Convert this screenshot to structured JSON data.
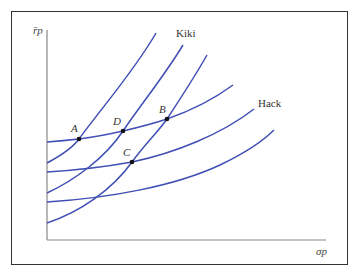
{
  "figure": {
    "y_axis_label": "r̄p",
    "x_axis_label": "σp",
    "curve_color": "#3f4fb5",
    "axis_color": "#888888",
    "frame_color": "#333333"
  },
  "labels": {
    "kiki": "Kiki",
    "hack": "Hack"
  },
  "points": [
    {
      "name": "A",
      "x": 79,
      "y": 139
    },
    {
      "name": "D",
      "x": 123,
      "y": 131
    },
    {
      "name": "B",
      "x": 167,
      "y": 119
    },
    {
      "name": "C",
      "x": 132,
      "y": 162
    }
  ],
  "curves": {
    "kiki": [
      {
        "id": "kiki-1",
        "path": "M47,163 C62,155 74,146 79,139 C100,110 135,70 156,33"
      },
      {
        "id": "kiki-2",
        "path": "M47,193 C75,180 105,158 123,131 C142,103 165,75 183,45"
      },
      {
        "id": "kiki-3",
        "path": "M47,223 C80,212 112,190 132,162 C145,144 157,133 167,119 C180,99 194,78 207,55"
      }
    ],
    "hack": [
      {
        "id": "hack-1",
        "path": "M47,142 C60,141 70,140 79,139 C95,137 110,134 123,131 C140,127 155,123 167,119 C190,111 214,99 233,85"
      },
      {
        "id": "hack-2",
        "path": "M47,172 C80,170 110,166 132,162 C175,153 222,134 254,109"
      },
      {
        "id": "hack-3",
        "path": "M47,202 C110,198 175,186 220,165 C245,153 262,142 274,130"
      }
    ]
  }
}
